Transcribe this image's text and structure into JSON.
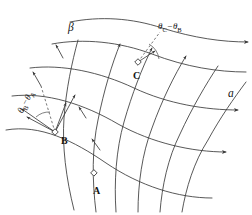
{
  "figure": {
    "kind": "characteristics-net",
    "width": 252,
    "height": 215,
    "background": "#ffffff",
    "stroke_color": "#3a3a3a",
    "dash_color": "#555555",
    "text_color": "#151515"
  },
  "labels": {
    "alpha_family": "a",
    "beta_family": "β",
    "point_a": "A",
    "point_b": "B",
    "point_c": "C",
    "angle_at_b": "θ",
    "angle_at_b_sub1": "B",
    "angle_at_b_minus": "−θ",
    "angle_at_b_sub2": "A",
    "angle_at_c": "θ",
    "angle_at_c_sub1": "C",
    "angle_at_c_minus": "−θ",
    "angle_at_c_sub2": "B"
  },
  "geometry": {
    "alpha_curves": [
      "M 6,130 C 40,124 74,141 106,163 C 140,186 178,198 212,198",
      "M 12,96 C 46,92 84,104 118,124 C 152,143 192,152 226,152",
      "M 30,68 C 62,64 100,72 134,88 C 168,104 206,110 238,110",
      "M 52,44 C 84,38 120,42 152,54 C 186,67 218,72 246,72",
      "M 70,22 C 100,16 132,18 162,28 C 194,38 222,42 248,42"
    ],
    "beta_curves": [
      "M 96,212 C 92,180 92,148 98,120 C 104,90 112,64 120,44",
      "M 116,212 C 114,182 116,150 124,122 C 132,94 142,68 152,48",
      "M 138,212 C 138,184 142,154 152,128 C 162,100 174,76 186,56",
      "M 160,212 C 162,186 168,158 180,134 C 192,108 206,84 218,66",
      "M 182,212 C 186,188 194,162 208,140 C 220,118 234,98 246,82",
      "M 74,210 C 66,178 62,146 64,118 C 66,90 72,62 78,40"
    ],
    "tangent_arrows_at_b": [
      {
        "x1": 55,
        "y1": 132,
        "x2": 26,
        "y2": 116
      },
      {
        "x1": 55,
        "y1": 132,
        "x2": 22,
        "y2": 108
      },
      {
        "x1": 55,
        "y1": 132,
        "x2": 74,
        "y2": 94
      }
    ],
    "dashed_lines": [
      {
        "x1": 55,
        "y1": 132,
        "x2": 42,
        "y2": 87
      },
      {
        "x1": 138,
        "y1": 62,
        "x2": 158,
        "y2": 33
      }
    ],
    "angle_arcs": [
      {
        "cx": 55,
        "cy": 132,
        "r": 20,
        "a1": 205,
        "a2": 288
      },
      {
        "cx": 138,
        "cy": 62,
        "r": 21,
        "a1": 303,
        "a2": 356
      }
    ],
    "point_markers": [
      {
        "name": "A",
        "x": 94,
        "y": 173
      },
      {
        "name": "B",
        "x": 55,
        "y": 132
      },
      {
        "name": "C",
        "x": 138,
        "y": 62
      }
    ]
  }
}
